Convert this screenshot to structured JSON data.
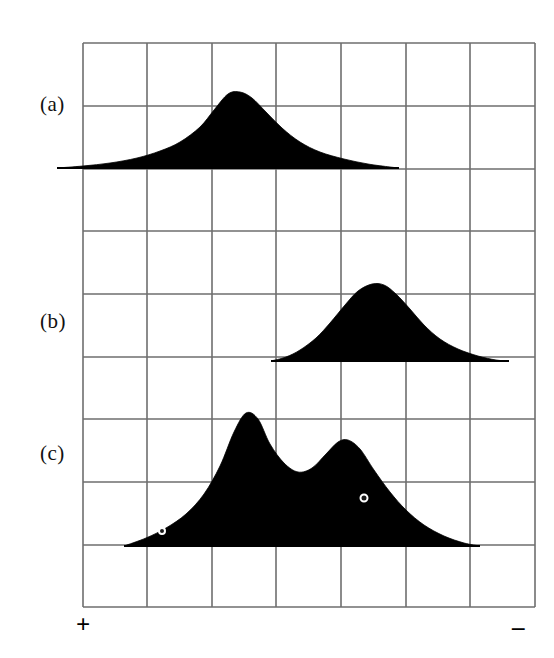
{
  "figure": {
    "background_color": "#ffffff",
    "ink_color": "#000000",
    "grid_color": "#6e6e6e",
    "panel_labels": [
      {
        "text": "(a)",
        "x": 40,
        "y": 92
      },
      {
        "text": "(b)",
        "x": 40,
        "y": 309
      },
      {
        "text": "(c)",
        "x": 40,
        "y": 441
      }
    ],
    "axis_signs": [
      {
        "name": "positive-sign",
        "text": "+",
        "x": 76,
        "y": 612
      },
      {
        "name": "negative-sign",
        "text": "–",
        "x": 512,
        "y": 614
      }
    ]
  },
  "chart_data": {
    "type": "area",
    "title": "",
    "subtitle": "",
    "xlabel": "",
    "ylabel": "",
    "grid": true,
    "legend": "none",
    "axis_annotations": {
      "left_end": "+",
      "right_end": "–"
    },
    "grid_geometry": {
      "left": 83,
      "right": 535,
      "top": 43,
      "bottom": 607,
      "columns": 7,
      "rows": 9,
      "col_width": 64.6,
      "row_height": 62.7,
      "vertical_lines_x": [
        83,
        147,
        212,
        276,
        341,
        406,
        470,
        535
      ],
      "horizontal_lines_y": [
        43,
        106,
        169,
        231,
        294,
        357,
        419,
        482,
        545,
        607
      ]
    },
    "panels": [
      {
        "label": "(a)",
        "description": "single broad unimodal distribution centred left of middle",
        "baseline_y": 168,
        "baseline_x_start": 57,
        "baseline_x_end": 399,
        "peaks": [
          {
            "x": 228,
            "y": 92,
            "height": 76
          }
        ],
        "markers": [],
        "points": [
          [
            57,
            168
          ],
          [
            83,
            166
          ],
          [
            110,
            163
          ],
          [
            137,
            158
          ],
          [
            160,
            151
          ],
          [
            180,
            142
          ],
          [
            200,
            127
          ],
          [
            214,
            110
          ],
          [
            228,
            94
          ],
          [
            240,
            92
          ],
          [
            252,
            98
          ],
          [
            266,
            112
          ],
          [
            282,
            128
          ],
          [
            300,
            142
          ],
          [
            320,
            152
          ],
          [
            344,
            159
          ],
          [
            368,
            164
          ],
          [
            390,
            167
          ],
          [
            399,
            168
          ]
        ]
      },
      {
        "label": "(b)",
        "description": "single unimodal distribution shifted to the right (negative side)",
        "baseline_y": 361,
        "baseline_x_start": 271,
        "baseline_x_end": 509,
        "peaks": [
          {
            "x": 372,
            "y": 283,
            "height": 78
          }
        ],
        "markers": [],
        "points": [
          [
            271,
            361
          ],
          [
            286,
            357
          ],
          [
            300,
            350
          ],
          [
            316,
            338
          ],
          [
            330,
            323
          ],
          [
            345,
            305
          ],
          [
            358,
            291
          ],
          [
            372,
            284
          ],
          [
            384,
            285
          ],
          [
            396,
            294
          ],
          [
            410,
            309
          ],
          [
            424,
            325
          ],
          [
            440,
            339
          ],
          [
            458,
            349
          ],
          [
            478,
            356
          ],
          [
            496,
            360
          ],
          [
            509,
            361
          ]
        ]
      },
      {
        "label": "(c)",
        "description": "bimodal distribution, taller left mode and lower right mode with a central trough",
        "baseline_y": 546,
        "baseline_x_start": 124,
        "baseline_x_end": 480,
        "peaks": [
          {
            "x": 246,
            "y": 413,
            "height": 133
          },
          {
            "x": 348,
            "y": 440,
            "height": 106
          }
        ],
        "valley": {
          "x": 300,
          "y": 472
        },
        "markers": [
          {
            "name": "data-dot-left",
            "x": 162,
            "y": 531,
            "radius": 3
          },
          {
            "name": "data-dot-right",
            "x": 364,
            "y": 498,
            "radius": 3.5
          }
        ],
        "points": [
          [
            124,
            546
          ],
          [
            146,
            538
          ],
          [
            166,
            528
          ],
          [
            186,
            514
          ],
          [
            204,
            494
          ],
          [
            220,
            466
          ],
          [
            234,
            432
          ],
          [
            246,
            413
          ],
          [
            258,
            419
          ],
          [
            270,
            444
          ],
          [
            284,
            463
          ],
          [
            298,
            472
          ],
          [
            312,
            468
          ],
          [
            326,
            454
          ],
          [
            338,
            442
          ],
          [
            348,
            440
          ],
          [
            360,
            449
          ],
          [
            374,
            470
          ],
          [
            390,
            492
          ],
          [
            406,
            510
          ],
          [
            424,
            525
          ],
          [
            444,
            536
          ],
          [
            464,
            543
          ],
          [
            480,
            546
          ]
        ]
      }
    ]
  }
}
